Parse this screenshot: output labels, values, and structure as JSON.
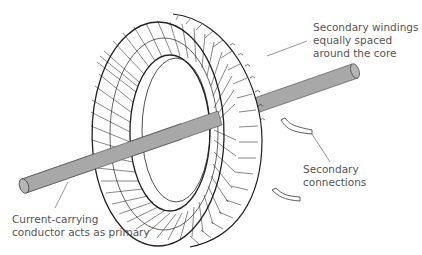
{
  "diagram": {
    "labels": {
      "secondary_windings": "Secondary windings\nequally spaced\naround the core",
      "secondary_connections": "Secondary connections",
      "primary_conductor": "Current-carrying\nconductor acts as primary"
    },
    "colors": {
      "conductor_fill": "#a8a8a8",
      "line": "#222222",
      "leader": "#666666",
      "text": "#555555"
    }
  }
}
